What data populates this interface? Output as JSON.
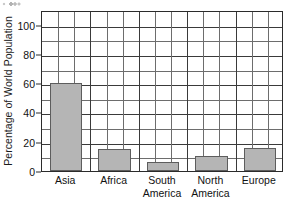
{
  "chart_data": {
    "type": "bar",
    "title": "",
    "xlabel": "",
    "ylabel": "Percentage of World Population",
    "categories": [
      "Asia",
      "Africa",
      "South\nAmerica",
      "North\nAmerica",
      "Europe"
    ],
    "values": [
      60,
      15,
      6,
      10,
      16
    ],
    "ylim": [
      0,
      110
    ],
    "ytick_labels": [
      "0",
      "20",
      "40",
      "60",
      "80",
      "100"
    ],
    "ytick_values": [
      0,
      20,
      40,
      60,
      80,
      100
    ],
    "minor_gridline_step": 10,
    "grid": "both",
    "vertical_gridline_count": 15,
    "legend": "none",
    "bar_color": "#b5b5b5",
    "bar_edge_color": "#5d5d5d",
    "axis_color": "#2b2b2b",
    "grid_color": "#6d6d6d",
    "background": "#ffffff"
  },
  "figure": {
    "artifact_label": "scan-speckle"
  }
}
